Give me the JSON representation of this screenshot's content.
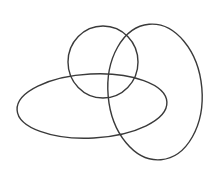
{
  "diagram": {
    "background": "#ffffff",
    "stroke_color": "#3a3a3a",
    "shapes": [
      {
        "name": "circle",
        "type": "ellipse",
        "cx": 103,
        "cy": 62,
        "rx": 35,
        "ry": 36,
        "rotation": 0
      },
      {
        "name": "horizontal-ellipse",
        "type": "ellipse",
        "cx": 92,
        "cy": 106,
        "rx": 75,
        "ry": 32,
        "rotation": -3
      },
      {
        "name": "vertical-ellipse",
        "type": "ellipse",
        "cx": 155,
        "cy": 92,
        "rx": 47,
        "ry": 68,
        "rotation": -5
      }
    ]
  }
}
